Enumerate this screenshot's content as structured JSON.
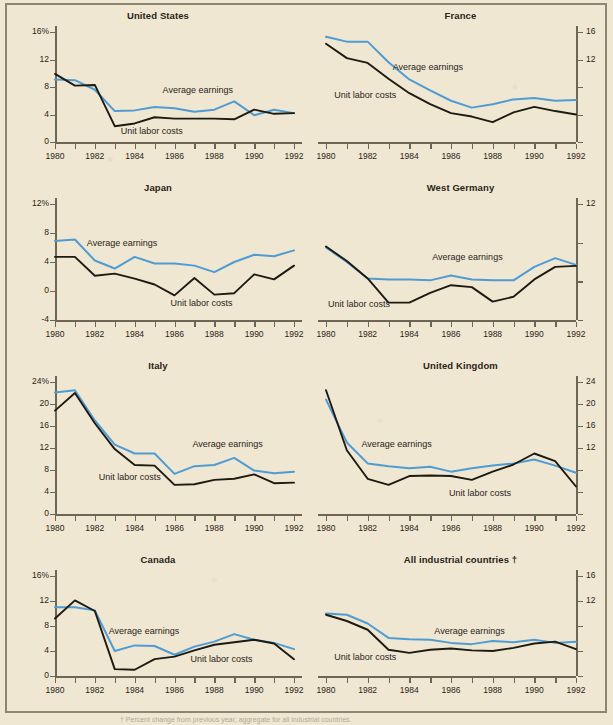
{
  "figure": {
    "background_color": "#efe7d2",
    "earnings_color": "#4f9cd4",
    "costs_color": "#1d1a12",
    "axis_color": "#6e6655",
    "zero_tick_color": "#a8593c",
    "footnote": "† Percent change from previous year; aggregate for all industrial countries."
  },
  "series_labels": {
    "earnings": "Average earnings",
    "costs": "Unit labor costs"
  },
  "x_tick_labels": [
    "1980",
    "1982",
    "1984",
    "1986",
    "1988",
    "1990",
    "1992"
  ],
  "chart_data": [
    {
      "type": "line",
      "title": "United States",
      "xlabel": "",
      "ylabel": "",
      "x": [
        1980,
        1981,
        1982,
        1983,
        1984,
        1985,
        1986,
        1987,
        1988,
        1989,
        1990,
        1991,
        1992
      ],
      "xlim": [
        1980,
        1992
      ],
      "ylim": [
        0,
        16
      ],
      "yticks": [
        0,
        4,
        8,
        12,
        16
      ],
      "ytick_labels": [
        "0",
        "4",
        "8",
        "12",
        "16%"
      ],
      "y_axis_side": "left",
      "grid": false,
      "legend": "inline-annotations",
      "series": [
        {
          "name": "Average earnings",
          "values": [
            9.1,
            9.0,
            7.6,
            4.5,
            4.6,
            5.1,
            4.9,
            4.4,
            4.7,
            5.9,
            3.9,
            4.7,
            4.2
          ]
        },
        {
          "name": "Unit labor costs",
          "values": [
            9.9,
            8.2,
            8.3,
            2.3,
            2.7,
            3.6,
            3.4,
            3.4,
            3.4,
            3.3,
            4.7,
            4.1,
            4.2
          ]
        }
      ],
      "annotations": [
        {
          "text": "Average earnings",
          "x": 1985.4,
          "y": 7.3
        },
        {
          "text": "Unit labor costs",
          "x": 1983.3,
          "y": 1.3
        }
      ]
    },
    {
      "type": "line",
      "title": "France",
      "xlabel": "",
      "ylabel": "",
      "x": [
        1980,
        1981,
        1982,
        1983,
        1984,
        1985,
        1986,
        1987,
        1988,
        1989,
        1990,
        1991,
        1992
      ],
      "xlim": [
        1980,
        1992
      ],
      "ylim": [
        0,
        16
      ],
      "yticks": [
        0,
        4,
        8,
        12,
        16
      ],
      "ytick_labels": [
        "0",
        "4",
        "8",
        "12",
        "16"
      ],
      "ytick_labels_visible": [
        "16",
        "12"
      ],
      "y_axis_side": "right",
      "grid": false,
      "legend": "inline-annotations",
      "series": [
        {
          "name": "Average earnings",
          "values": [
            15.3,
            14.6,
            14.6,
            11.6,
            9.1,
            7.5,
            6.0,
            5.0,
            5.5,
            6.2,
            6.4,
            6.0,
            6.1
          ]
        },
        {
          "name": "Unit labor costs",
          "values": [
            14.3,
            12.2,
            11.5,
            9.2,
            7.1,
            5.5,
            4.2,
            3.7,
            2.9,
            4.3,
            5.1,
            4.5,
            4.0
          ]
        }
      ],
      "annotations": [
        {
          "text": "Average earnings",
          "x": 1983.2,
          "y": 10.6
        },
        {
          "text": "Unit labor costs",
          "x": 1980.4,
          "y": 6.6
        }
      ]
    },
    {
      "type": "line",
      "title": "Japan",
      "xlabel": "",
      "ylabel": "",
      "x": [
        1980,
        1981,
        1982,
        1983,
        1984,
        1985,
        1986,
        1987,
        1988,
        1989,
        1990,
        1991,
        1992
      ],
      "xlim": [
        1980,
        1992
      ],
      "ylim": [
        -4,
        12
      ],
      "yticks": [
        -4,
        0,
        4,
        8,
        12
      ],
      "ytick_labels": [
        "-4",
        "0",
        "4",
        "8",
        "12%"
      ],
      "y_axis_side": "left",
      "grid": false,
      "legend": "inline-annotations",
      "series": [
        {
          "name": "Average earnings",
          "values": [
            6.9,
            7.1,
            4.2,
            3.1,
            4.7,
            3.8,
            3.8,
            3.5,
            2.6,
            4.0,
            5.0,
            4.8,
            5.6
          ]
        },
        {
          "name": "Unit labor costs",
          "values": [
            4.7,
            4.7,
            2.1,
            2.4,
            1.7,
            0.9,
            -0.6,
            1.8,
            -0.5,
            -0.3,
            2.3,
            1.6,
            3.5
          ]
        }
      ],
      "annotations": [
        {
          "text": "Average earnings",
          "x": 1981.6,
          "y": 6.4
        },
        {
          "text": "Unit labor costs",
          "x": 1985.8,
          "y": -1.9
        }
      ]
    },
    {
      "type": "line",
      "title": "West Germany",
      "xlabel": "",
      "ylabel": "",
      "x": [
        1980,
        1981,
        1982,
        1983,
        1984,
        1985,
        1986,
        1987,
        1988,
        1989,
        1990,
        1991,
        1992
      ],
      "xlim": [
        1980,
        1992
      ],
      "ylim": [
        0,
        12
      ],
      "yticks": [
        0,
        4,
        8,
        12
      ],
      "ytick_labels": [
        "0",
        "4",
        "8",
        "12"
      ],
      "ytick_labels_visible": [
        "12"
      ],
      "y_axis_side": "right",
      "grid": false,
      "legend": "inline-annotations",
      "series": [
        {
          "name": "Average earnings",
          "values": [
            7.5,
            6.0,
            4.3,
            4.2,
            4.2,
            4.1,
            4.6,
            4.2,
            4.1,
            4.1,
            5.5,
            6.4,
            5.7
          ]
        },
        {
          "name": "Unit labor costs",
          "values": [
            7.6,
            6.1,
            4.3,
            1.8,
            1.8,
            2.8,
            3.6,
            3.4,
            1.9,
            2.4,
            4.2,
            5.5,
            5.6
          ]
        }
      ],
      "annotations": [
        {
          "text": "Average earnings",
          "x": 1985.1,
          "y": 6.3
        },
        {
          "text": "Unit labor costs",
          "x": 1980.1,
          "y": 1.5
        }
      ]
    },
    {
      "type": "line",
      "title": "Italy",
      "xlabel": "",
      "ylabel": "",
      "x": [
        1980,
        1981,
        1982,
        1983,
        1984,
        1985,
        1986,
        1987,
        1988,
        1989,
        1990,
        1991,
        1992
      ],
      "xlim": [
        1980,
        1992
      ],
      "ylim": [
        0,
        24
      ],
      "yticks": [
        0,
        4,
        8,
        12,
        16,
        20,
        24
      ],
      "ytick_labels": [
        "0",
        "4",
        "8",
        "12",
        "16",
        "20",
        "24%"
      ],
      "y_axis_side": "left",
      "grid": false,
      "legend": "inline-annotations",
      "series": [
        {
          "name": "Average earnings",
          "values": [
            22.1,
            22.5,
            17.0,
            12.6,
            11.0,
            11.0,
            7.3,
            8.7,
            8.9,
            10.2,
            7.9,
            7.4,
            7.7
          ]
        },
        {
          "name": "Unit labor costs",
          "values": [
            18.8,
            22.0,
            16.5,
            11.8,
            8.9,
            8.8,
            5.3,
            5.4,
            6.2,
            6.4,
            7.2,
            5.6,
            5.7
          ]
        }
      ],
      "annotations": [
        {
          "text": "Average earnings",
          "x": 1986.9,
          "y": 12.3
        },
        {
          "text": "Unit labor costs",
          "x": 1982.2,
          "y": 6.3
        }
      ]
    },
    {
      "type": "line",
      "title": "United Kingdom",
      "xlabel": "",
      "ylabel": "",
      "x": [
        1980,
        1981,
        1982,
        1983,
        1984,
        1985,
        1986,
        1987,
        1988,
        1989,
        1990,
        1991,
        1992
      ],
      "xlim": [
        1980,
        1992
      ],
      "ylim": [
        0,
        24
      ],
      "yticks": [
        0,
        4,
        8,
        12,
        16,
        20,
        24
      ],
      "ytick_labels": [
        "0",
        "4",
        "8",
        "12",
        "16",
        "20",
        "24"
      ],
      "ytick_labels_visible": [
        "24",
        "20",
        "16",
        "12"
      ],
      "y_axis_side": "right",
      "grid": false,
      "legend": "inline-annotations",
      "series": [
        {
          "name": "Average earnings",
          "values": [
            20.8,
            13.0,
            9.2,
            8.7,
            8.3,
            8.6,
            7.7,
            8.3,
            8.8,
            9.2,
            9.9,
            8.8,
            7.5
          ]
        },
        {
          "name": "Unit labor costs",
          "values": [
            22.5,
            11.6,
            6.4,
            5.3,
            6.9,
            7.0,
            6.9,
            6.2,
            7.7,
            9.0,
            11.0,
            9.6,
            5.0
          ]
        }
      ],
      "annotations": [
        {
          "text": "Average earnings",
          "x": 1981.7,
          "y": 12.4
        },
        {
          "text": "Unit labor costs",
          "x": 1985.9,
          "y": 3.4
        }
      ]
    },
    {
      "type": "line",
      "title": "Canada",
      "xlabel": "",
      "ylabel": "",
      "x": [
        1980,
        1981,
        1982,
        1983,
        1984,
        1985,
        1986,
        1987,
        1988,
        1989,
        1990,
        1991,
        1992
      ],
      "xlim": [
        1980,
        1992
      ],
      "ylim": [
        0,
        16
      ],
      "yticks": [
        0,
        4,
        8,
        12,
        16
      ],
      "ytick_labels": [
        "0",
        "4",
        "8",
        "12",
        "16%"
      ],
      "y_axis_side": "left",
      "grid": false,
      "legend": "inline-annotations",
      "series": [
        {
          "name": "Average earnings",
          "values": [
            11.0,
            11.0,
            10.5,
            4.0,
            4.9,
            4.8,
            3.4,
            4.7,
            5.5,
            6.7,
            5.8,
            5.3,
            4.3
          ]
        },
        {
          "name": "Unit labor costs",
          "values": [
            9.2,
            12.1,
            10.4,
            1.1,
            1.0,
            2.7,
            3.1,
            4.1,
            5.0,
            5.4,
            5.8,
            5.2,
            2.7
          ]
        }
      ],
      "annotations": [
        {
          "text": "Average earnings",
          "x": 1982.7,
          "y": 6.9
        },
        {
          "text": "Unit labor costs",
          "x": 1986.8,
          "y": 2.4
        }
      ]
    },
    {
      "type": "line",
      "title": "All industrial countries †",
      "xlabel": "",
      "ylabel": "",
      "x": [
        1980,
        1981,
        1982,
        1983,
        1984,
        1985,
        1986,
        1987,
        1988,
        1989,
        1990,
        1991,
        1992
      ],
      "xlim": [
        1980,
        1992
      ],
      "ylim": [
        0,
        16
      ],
      "yticks": [
        0,
        4,
        8,
        12,
        16
      ],
      "ytick_labels": [
        "0",
        "4",
        "8",
        "12",
        "16"
      ],
      "ytick_labels_visible": [
        "16",
        "12"
      ],
      "y_axis_side": "right",
      "grid": false,
      "legend": "inline-annotations",
      "series": [
        {
          "name": "Average earnings",
          "values": [
            10.0,
            9.8,
            8.4,
            6.1,
            5.9,
            5.8,
            5.3,
            5.1,
            5.6,
            5.4,
            5.8,
            5.3,
            5.5
          ]
        },
        {
          "name": "Unit labor costs",
          "values": [
            9.8,
            8.8,
            7.4,
            4.2,
            3.7,
            4.2,
            4.4,
            4.1,
            4.0,
            4.5,
            5.2,
            5.5,
            4.3
          ]
        }
      ],
      "annotations": [
        {
          "text": "Average earnings",
          "x": 1985.2,
          "y": 6.9
        },
        {
          "text": "Unit labor costs",
          "x": 1980.4,
          "y": 2.7
        }
      ]
    }
  ]
}
